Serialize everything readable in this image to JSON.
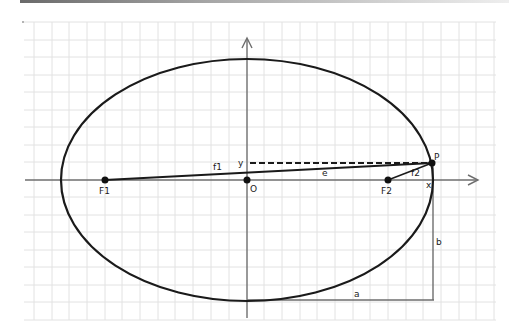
{
  "diagram": {
    "type": "ellipse-geometry",
    "colors": {
      "grid": "#e2e2e2",
      "axis": "#6e6e6e",
      "curve": "#1a1a1a",
      "background": "#ffffff"
    },
    "labels": {
      "focus1": "F1",
      "focus2": "F2",
      "origin": "O",
      "point": "P",
      "dist_f1": "f1",
      "dist_f2": "f2",
      "dist_e": "e",
      "coord_y": "y",
      "coord_x": "x",
      "semi_major": "a",
      "semi_minor": "b"
    },
    "points": {
      "F1": [
        105,
        180
      ],
      "O": [
        247,
        180
      ],
      "F2": [
        388,
        180
      ],
      "P": [
        432,
        163
      ]
    },
    "ellipse": {
      "cx": 247,
      "cy": 180,
      "rx": 186,
      "ry": 121
    }
  }
}
